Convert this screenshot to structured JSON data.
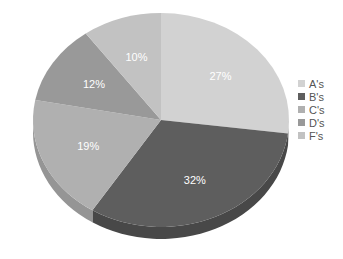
{
  "chart_data": {
    "type": "pie",
    "style": "3d",
    "title": "",
    "categories": [
      "A's",
      "B's",
      "C's",
      "D's",
      "F's"
    ],
    "values": [
      27,
      32,
      19,
      12,
      10
    ],
    "labels": [
      "27%",
      "32%",
      "19%",
      "12%",
      "10%"
    ],
    "colors": [
      "#d2d2d2",
      "#5e5e5e",
      "#b0b0b0",
      "#999999",
      "#c2c2c2"
    ],
    "side_colors": [
      "#b5b5b5",
      "#484848",
      "#959595",
      "#808080",
      "#a5a5a5"
    ],
    "start_angle": "12 o'clock",
    "direction": "clockwise",
    "legend_position": "right"
  },
  "legend": {
    "items": [
      {
        "label": "A's",
        "color": "#d2d2d2"
      },
      {
        "label": "B's",
        "color": "#5e5e5e"
      },
      {
        "label": "C's",
        "color": "#b0b0b0"
      },
      {
        "label": "D's",
        "color": "#999999"
      },
      {
        "label": "F's",
        "color": "#c2c2c2"
      }
    ]
  }
}
